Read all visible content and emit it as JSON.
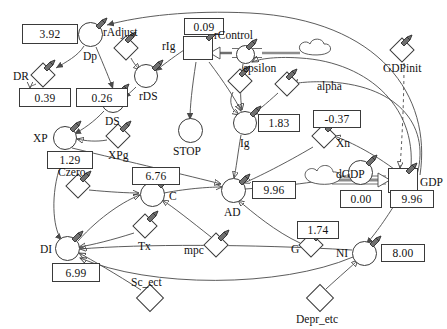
{
  "diagram": {
    "type": "stock-and-flow",
    "stroke_color": "#3a3a3a",
    "background": "#ffffff"
  },
  "nodes": [
    {
      "id": "Dp",
      "label": "Dp",
      "shape": "circle",
      "x": 90,
      "y": 34
    },
    {
      "id": "rAdjust",
      "label": "rAdjust",
      "shape": "diamond",
      "x": 126,
      "y": 48
    },
    {
      "id": "rDS",
      "label": "rDS",
      "shape": "circle",
      "x": 146,
      "y": 76
    },
    {
      "id": "rIg",
      "label": "rIg",
      "shape": "stock",
      "x": 196,
      "y": 47
    },
    {
      "id": "rControl",
      "label": "rControl",
      "shape": "circle",
      "x": 247,
      "y": 53
    },
    {
      "id": "epsilon",
      "label": "epsilon",
      "shape": "diamond",
      "x": 240,
      "y": 81
    },
    {
      "id": "alpha",
      "label": "alpha",
      "shape": "diamond",
      "x": 287,
      "y": 84
    },
    {
      "id": "GDPinit",
      "label": "GDPinit",
      "shape": "diamond",
      "x": 402,
      "y": 50
    },
    {
      "id": "DR",
      "label": "DR",
      "shape": "diamond",
      "x": 43,
      "y": 75
    },
    {
      "id": "DS",
      "label": "DS",
      "shape": "circle",
      "x": 113,
      "y": 101
    },
    {
      "id": "STOP",
      "label": "STOP",
      "shape": "circle",
      "x": 190,
      "y": 130
    },
    {
      "id": "Ig",
      "label": "Ig",
      "shape": "circle",
      "x": 245,
      "y": 123
    },
    {
      "id": "Xn",
      "label": "Xn",
      "shape": "diamond",
      "x": 324,
      "y": 136
    },
    {
      "id": "XP",
      "label": "XP",
      "shape": "circle",
      "x": 65,
      "y": 138
    },
    {
      "id": "XPg",
      "label": "XPg",
      "shape": "diamond",
      "x": 118,
      "y": 136
    },
    {
      "id": "Czero",
      "label": "Czero",
      "shape": "diamond",
      "x": 78,
      "y": 186
    },
    {
      "id": "C",
      "label": "C",
      "shape": "circle",
      "x": 152,
      "y": 194
    },
    {
      "id": "AD",
      "label": "AD",
      "shape": "circle",
      "x": 233,
      "y": 190
    },
    {
      "id": "dGDP",
      "label": "dGDP",
      "shape": "flow",
      "x": 360,
      "y": 172
    },
    {
      "id": "GDP",
      "label": "GDP",
      "shape": "stock",
      "x": 405,
      "y": 180
    },
    {
      "id": "Tx",
      "label": "Tx",
      "shape": "diamond",
      "x": 145,
      "y": 226
    },
    {
      "id": "mpc",
      "label": "mpc",
      "shape": "diamond",
      "x": 216,
      "y": 245
    },
    {
      "id": "G",
      "label": "G",
      "shape": "diamond",
      "x": 311,
      "y": 245
    },
    {
      "id": "DI",
      "label": "DI",
      "shape": "circle",
      "x": 67,
      "y": 248
    },
    {
      "id": "NI",
      "label": "NI",
      "shape": "circle",
      "x": 364,
      "y": 253
    },
    {
      "id": "Sc_ect",
      "label": "Sc_ect",
      "shape": "diamond",
      "x": 150,
      "y": 298
    },
    {
      "id": "Depr_etc",
      "label": "Depr_etc",
      "shape": "diamond",
      "x": 320,
      "y": 298
    }
  ],
  "values": [
    {
      "for": "Dp",
      "value": "3.92",
      "x": 22,
      "y": 24,
      "w": 56,
      "h": 20
    },
    {
      "for": "rIg",
      "value": "0.09",
      "x": 184,
      "y": 18,
      "w": 40,
      "h": 17
    },
    {
      "for": "DR",
      "value": "0.39",
      "x": 19,
      "y": 88,
      "w": 52,
      "h": 19
    },
    {
      "for": "DS",
      "value": "0.26",
      "x": 76,
      "y": 88,
      "w": 52,
      "h": 19
    },
    {
      "for": "Ig",
      "value": "1.83",
      "x": 258,
      "y": 114,
      "w": 42,
      "h": 18
    },
    {
      "for": "Xn",
      "value": "-0.37",
      "x": 313,
      "y": 110,
      "w": 48,
      "h": 18
    },
    {
      "for": "XP",
      "value": "1.29",
      "x": 47,
      "y": 151,
      "w": 46,
      "h": 18
    },
    {
      "for": "C",
      "value": "6.76",
      "x": 132,
      "y": 167,
      "w": 48,
      "h": 18
    },
    {
      "for": "AD",
      "value": "9.96",
      "x": 252,
      "y": 181,
      "w": 44,
      "h": 18
    },
    {
      "for": "dGDP",
      "value": "0.00",
      "x": 340,
      "y": 190,
      "w": 42,
      "h": 18
    },
    {
      "for": "GDP",
      "value": "9.96",
      "x": 390,
      "y": 190,
      "w": 44,
      "h": 18
    },
    {
      "for": "G",
      "value": "1.74",
      "x": 297,
      "y": 221,
      "w": 42,
      "h": 18
    },
    {
      "for": "NI",
      "value": "8.00",
      "x": 381,
      "y": 244,
      "w": 44,
      "h": 18
    },
    {
      "for": "DI",
      "value": "6.99",
      "x": 52,
      "y": 263,
      "w": 48,
      "h": 19
    }
  ],
  "labels": {
    "Dp": "Dp",
    "rAdjust": "rAdjust",
    "rDS": "rDS",
    "rIg": "rIg",
    "rControl": "rControl",
    "epsilon": "epsilon",
    "alpha": "alpha",
    "GDPinit": "GDPinit",
    "DR": "DR",
    "DS": "DS",
    "STOP": "STOP",
    "Ig": "Ig",
    "Xn": "Xn",
    "XP": "XP",
    "XPg": "XPg",
    "Czero": "Czero",
    "C": "C",
    "AD": "AD",
    "dGDP": "dGDP",
    "GDP": "GDP",
    "Tx": "Tx",
    "mpc": "mpc",
    "G": "G",
    "DI": "DI",
    "NI": "NI",
    "Sc_ect": "Sc_ect",
    "Depr_etc": "Depr_etc"
  }
}
